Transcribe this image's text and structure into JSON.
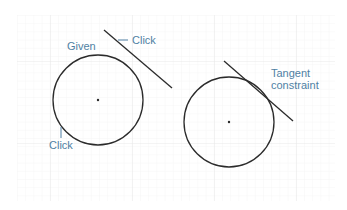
{
  "diagram": {
    "colors": {
      "stroke": "#2b2b2b",
      "label": "#4f7fa3",
      "grid_minor": "#f1f1f1",
      "grid_major": "#e6e6e6"
    },
    "left_panel": {
      "given_label": "Given",
      "click_line_label": "Click",
      "click_circle_label": "Click"
    },
    "right_panel": {
      "constraint_label_line1": "Tangent",
      "constraint_label_line2": "constraint"
    }
  }
}
